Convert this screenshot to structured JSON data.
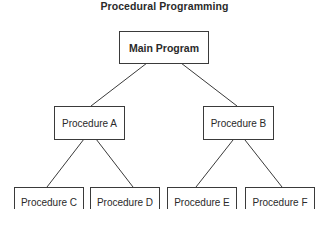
{
  "title": "Procedural Programming",
  "nodes": {
    "main": "Main Program",
    "a": "Procedure A",
    "b": "Procedure B",
    "c": "Procedure C",
    "d": "Procedure D",
    "e": "Procedure E",
    "f": "Procedure F"
  },
  "edges": [
    [
      "Main Program",
      "Procedure A"
    ],
    [
      "Main Program",
      "Procedure B"
    ],
    [
      "Procedure A",
      "Procedure C"
    ],
    [
      "Procedure A",
      "Procedure D"
    ],
    [
      "Procedure B",
      "Procedure E"
    ],
    [
      "Procedure B",
      "Procedure F"
    ]
  ]
}
